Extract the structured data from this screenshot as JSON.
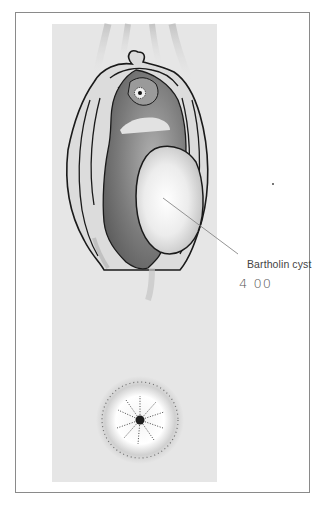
{
  "figure": {
    "type": "medical-illustration",
    "annotations": {
      "cyst_label": "Bartholin cyst",
      "handwritten_note": "4 00"
    },
    "colors": {
      "panel_bg": "#e6e6e6",
      "frame_border": "#8a8a8a",
      "outline": "#1a1a1a",
      "vestibule_dark": "#6e6e6e",
      "cyst_highlight": "#ffffff",
      "pointer_line": "#888888"
    }
  }
}
